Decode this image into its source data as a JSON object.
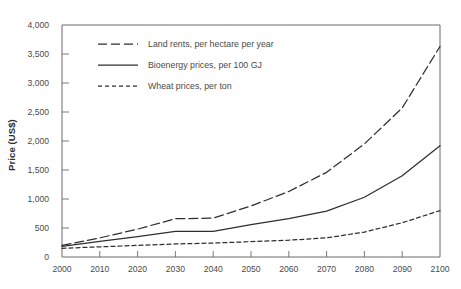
{
  "chart_data": {
    "type": "line",
    "title": "",
    "xlabel": "",
    "ylabel": "Price (US$)",
    "xlim": [
      2000,
      2100
    ],
    "ylim": [
      0,
      4000
    ],
    "grid": false,
    "legend_position": "top-left-inside",
    "x": [
      2000,
      2010,
      2020,
      2030,
      2040,
      2050,
      2060,
      2070,
      2080,
      2090,
      2100
    ],
    "xticklabels": [
      "2000",
      "2010",
      "2020",
      "2030",
      "2040",
      "2050",
      "2060",
      "2070",
      "2080",
      "2090",
      "2100"
    ],
    "yticks": [
      0,
      500,
      1000,
      1500,
      2000,
      2500,
      3000,
      3500,
      4000
    ],
    "yticklabels": [
      "0",
      "500",
      "1,000",
      "1,500",
      "2,000",
      "2,500",
      "3,000",
      "3,500",
      "4,000"
    ],
    "series": [
      {
        "name": "Land rents, per hectare per year",
        "style": "long-dash",
        "color": "#2f2f2f",
        "values": [
          200,
          330,
          480,
          660,
          670,
          880,
          1130,
          1460,
          1950,
          2570,
          3630
        ]
      },
      {
        "name": "Bioenergy prices, per 100 GJ",
        "style": "solid",
        "color": "#2f2f2f",
        "values": [
          185,
          270,
          350,
          440,
          440,
          560,
          660,
          790,
          1030,
          1400,
          1920
        ]
      },
      {
        "name": "Wheat prices, per ton",
        "style": "short-dash",
        "color": "#2f2f2f",
        "values": [
          150,
          175,
          200,
          225,
          240,
          265,
          290,
          330,
          430,
          590,
          800
        ]
      }
    ]
  },
  "legend": {
    "items": [
      {
        "label": "Land rents, per hectare per year"
      },
      {
        "label": "Bioenergy prices, per 100 GJ"
      },
      {
        "label": "Wheat prices, per ton"
      }
    ]
  }
}
